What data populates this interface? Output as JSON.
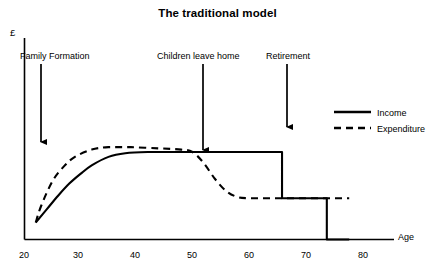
{
  "chart_data": {
    "type": "line",
    "title": "The traditional model",
    "xlabel": "Age",
    "ylabel": "£",
    "xlim": [
      18,
      84
    ],
    "ylim": [
      0,
      100
    ],
    "xticks": [
      20,
      30,
      40,
      50,
      60,
      70,
      80
    ],
    "grid": false,
    "legend_position": "right",
    "series": [
      {
        "name": "Income",
        "style": "solid",
        "color": "#000000",
        "x": [
          20,
          22,
          24,
          26,
          28,
          30,
          33,
          36,
          40,
          45,
          50,
          55,
          60,
          64,
          64,
          70,
          72,
          72,
          76
        ],
        "values": [
          14,
          25,
          36,
          46,
          54,
          61,
          68,
          71,
          72,
          72,
          72,
          72,
          72,
          72,
          34,
          34,
          34,
          0,
          0
        ]
      },
      {
        "name": "Expenditure",
        "style": "dashed",
        "color": "#000000",
        "x": [
          20,
          21,
          23,
          25,
          27,
          30,
          33,
          37,
          42,
          46,
          48,
          50,
          52,
          54,
          56,
          58,
          62,
          66,
          72,
          76
        ],
        "values": [
          14,
          28,
          48,
          60,
          68,
          74,
          76,
          76,
          75,
          74,
          72,
          63,
          50,
          40,
          35,
          34,
          34,
          34,
          34,
          34
        ]
      }
    ],
    "annotations": [
      {
        "label": "Family Formation",
        "x": 24,
        "label_left_px": 20,
        "arrow_x_px": 41,
        "arrow_y_end_px": 142
      },
      {
        "label": "Children leave home",
        "x": 50,
        "label_left_px": 157,
        "arrow_x_px": 203,
        "arrow_y_end_px": 150
      },
      {
        "label": "Retirement",
        "x": 64,
        "label_left_px": 266,
        "arrow_x_px": 287,
        "arrow_y_end_px": 127
      }
    ]
  },
  "legend": {
    "income_label": "Income",
    "expenditure_label": "Expenditure"
  },
  "ticks": {
    "t20": "20",
    "t30": "30",
    "t40": "40",
    "t50": "50",
    "t60": "60",
    "t70": "70",
    "t80": "80"
  }
}
